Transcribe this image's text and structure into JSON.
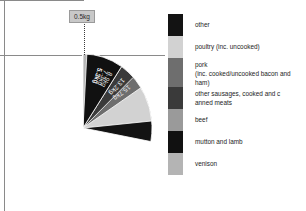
{
  "chart_data": {
    "type": "pie",
    "title": "",
    "unit": "kg",
    "categories": [
      "other",
      "poultry (inc. uncooked)",
      "pork (inc. cooked/uncooked bacon and ham)",
      "other sausages, cooked and canned meats",
      "beef",
      "mutton and lamb",
      "venison"
    ],
    "values": [
      15.7,
      13.2,
      8.9,
      7.3,
      5.3,
      5.3,
      0.5
    ],
    "labels": [
      "15.7kg",
      "13.2kg",
      "8.9kg",
      "7.3kg",
      "5.3kg",
      "5.3kg",
      "0.5kg"
    ],
    "colors": [
      "#131313",
      "#d2d2d2",
      "#6e6e6e",
      "#3a3a3a",
      "#9a9a9a",
      "#111111",
      "#b4b4b4"
    ],
    "legend_position": "right",
    "grid": false,
    "callout_label": "0.5kg"
  },
  "pie": {
    "slice_labels": [
      {
        "text": "15.7kg"
      },
      {
        "text": "13.2kg"
      },
      {
        "text": "8.9kg"
      },
      {
        "text": "7.3kg"
      },
      {
        "text": "5.3kg"
      },
      {
        "text": "5.3kg"
      }
    ],
    "callout": {
      "value": "0.5kg"
    }
  },
  "legend": {
    "items": [
      {
        "label": "other",
        "line2": "",
        "color": "#131313"
      },
      {
        "label": "poultry (inc. uncooked)",
        "line2": "",
        "color": "#d2d2d2"
      },
      {
        "label": "pork",
        "line2": "(inc. cooked/uncooked bacon and ham)",
        "color": "#6e6e6e"
      },
      {
        "label": "other sausages, cooked and c",
        "line2": "anned meats",
        "color": "#3a3a3a"
      },
      {
        "label": "beef",
        "line2": "",
        "color": "#9a9a9a"
      },
      {
        "label": "mutton and lamb",
        "line2": "",
        "color": "#111111"
      },
      {
        "label": "venison",
        "line2": "",
        "color": "#b4b4b4"
      }
    ]
  }
}
